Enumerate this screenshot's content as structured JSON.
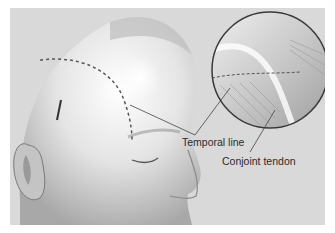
{
  "figure": {
    "background_color": "#d9d9d9",
    "labels": [
      {
        "id": "temporal-line",
        "text": "Temporal line"
      },
      {
        "id": "conjoint-tendon",
        "text": "Conjoint tendon"
      }
    ],
    "elements": [
      "head-profile",
      "ear",
      "closed-eye",
      "nose",
      "dashed-temporal-line",
      "incision-mark",
      "magnified-inset-circle"
    ]
  }
}
